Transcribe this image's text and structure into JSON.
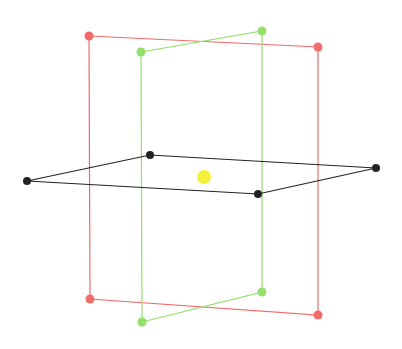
{
  "diagram": {
    "title": "",
    "background": "#ffffff",
    "planes": [
      {
        "name": "red-vertical-plane",
        "color": "#f26b6b",
        "stroke_width": 1.2,
        "dot_radius": 4.5,
        "points": [
          [
            89,
            36
          ],
          [
            318,
            47
          ],
          [
            318,
            315
          ],
          [
            90,
            299
          ]
        ]
      },
      {
        "name": "green-vertical-plane",
        "color": "#94e06a",
        "stroke_width": 1.2,
        "dot_radius": 4.5,
        "points": [
          [
            141,
            52
          ],
          [
            262,
            31
          ],
          [
            262,
            292
          ],
          [
            142,
            322
          ]
        ]
      },
      {
        "name": "black-horizontal-plane",
        "color": "#222222",
        "stroke_width": 1.2,
        "dot_radius": 4,
        "points": [
          [
            27,
            181
          ],
          [
            150,
            155
          ],
          [
            376,
            168
          ],
          [
            258,
            194
          ]
        ]
      }
    ],
    "center_point": {
      "name": "yellow-center-point",
      "color": "#f5f03a",
      "x": 204,
      "y": 177,
      "r": 7
    }
  }
}
